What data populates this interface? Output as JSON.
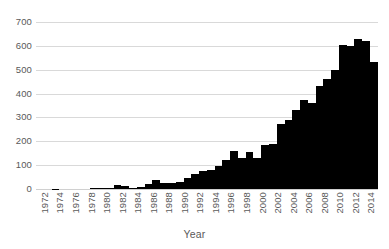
{
  "chart_data": {
    "type": "bar",
    "title": "",
    "xlabel": "Year",
    "ylabel": "",
    "ylim": [
      0,
      700
    ],
    "ytick_step": 100,
    "yticks": [
      0,
      100,
      200,
      300,
      400,
      500,
      600,
      700
    ],
    "ytick_labels": [
      "0",
      "100",
      "200",
      "300",
      "400",
      "500",
      "600",
      "700"
    ],
    "grid": true,
    "grid_axis": "y",
    "legend": false,
    "legend_position": "none",
    "bar_color": "#000000",
    "background_color": "#ffffff",
    "gridline_color": "#d9d9d9",
    "text_color": "#595959",
    "xtick_label_rotation": 90,
    "xtick_label_interval": 2,
    "xtick_labels_shown": [
      "1972",
      "1974",
      "1976",
      "1978",
      "1980",
      "1982",
      "1984",
      "1986",
      "1988",
      "1990",
      "1992",
      "1994",
      "1996",
      "1998",
      "2000",
      "2002",
      "2004",
      "2006",
      "2008",
      "2010",
      "2012",
      "2014"
    ],
    "categories": [
      "1972",
      "1973",
      "1974",
      "1975",
      "1976",
      "1977",
      "1978",
      "1979",
      "1980",
      "1981",
      "1982",
      "1983",
      "1984",
      "1985",
      "1986",
      "1987",
      "1988",
      "1989",
      "1990",
      "1991",
      "1992",
      "1993",
      "1994",
      "1995",
      "1996",
      "1997",
      "1998",
      "1999",
      "2000",
      "2001",
      "2002",
      "2003",
      "2004",
      "2005",
      "2006",
      "2007",
      "2008",
      "2009",
      "2010",
      "2011",
      "2012",
      "2013",
      "2014",
      "2015"
    ],
    "values": [
      0,
      0,
      2,
      0,
      0,
      0,
      0,
      3,
      4,
      4,
      15,
      12,
      6,
      8,
      22,
      38,
      25,
      27,
      30,
      48,
      62,
      75,
      78,
      95,
      120,
      160,
      128,
      155,
      128,
      185,
      188,
      272,
      288,
      332,
      372,
      362,
      432,
      460,
      500,
      602,
      600,
      630,
      622,
      532
    ],
    "series_name": "Count"
  }
}
